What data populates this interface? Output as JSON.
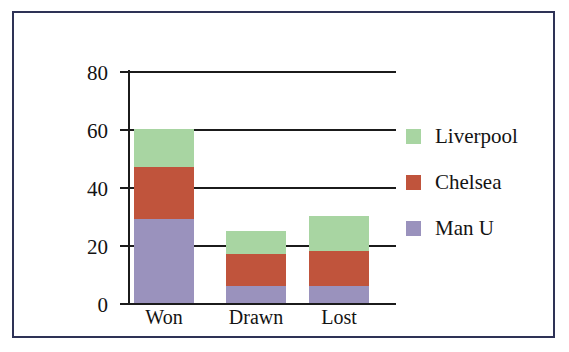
{
  "chart_data": {
    "type": "bar",
    "subtype": "stacked-vertical",
    "title": "",
    "xlabel": "",
    "ylabel": "",
    "categories": [
      "Won",
      "Drawn",
      "Lost"
    ],
    "series": [
      {
        "name": "Man U",
        "color": "#9a92bd",
        "values": [
          29,
          6,
          6
        ]
      },
      {
        "name": "Chelsea",
        "color": "#c0543c",
        "values": [
          18,
          11,
          12
        ]
      },
      {
        "name": "Liverpool",
        "color": "#a8d5a2",
        "values": [
          13,
          8,
          12
        ]
      }
    ],
    "stack_totals": [
      60,
      25,
      30
    ],
    "ylim": [
      0,
      80
    ],
    "ytick_labels": [
      "0",
      "20",
      "40",
      "60",
      "80"
    ],
    "ytick_values": [
      0,
      20,
      40,
      60,
      80
    ],
    "grid": "horizontal",
    "legend_position": "right",
    "legend_order": [
      "Liverpool",
      "Chelsea",
      "Man U"
    ],
    "axis_color": "#1b1b1b",
    "frame_color": "#2e3256",
    "background_color": "#ffffff"
  }
}
